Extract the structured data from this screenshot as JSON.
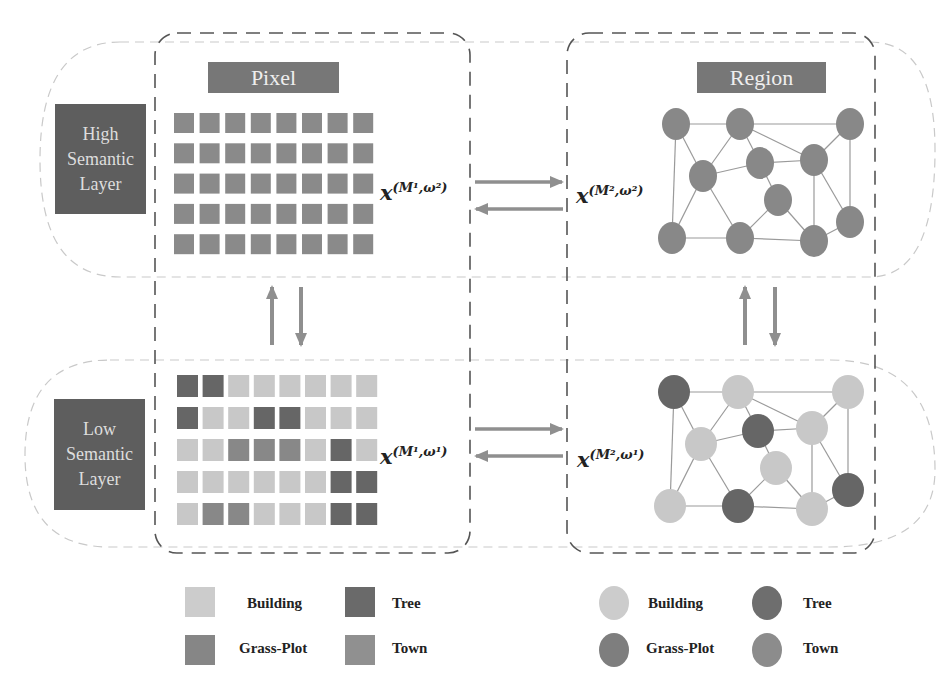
{
  "colors": {
    "building": "#c8c8c8",
    "tree": "#666666",
    "grass_plot": "#888888",
    "town": "#8a8a8a",
    "high_pixel": "#8a8a8a",
    "high_node": "#888888",
    "arrow": "#8f8f8f",
    "layer_box": "#5e5e5e",
    "title_box": "#777777"
  },
  "columns": {
    "pixel": {
      "title": "Pixel"
    },
    "region": {
      "title": "Region"
    }
  },
  "layers": {
    "high": {
      "label_lines": [
        "High",
        "Semantic",
        "Layer"
      ]
    },
    "low": {
      "label_lines": [
        "Low",
        "Semantic",
        "Layer"
      ]
    }
  },
  "labels": {
    "pixel_high": {
      "base": "x",
      "sup": "(M¹,ω²)"
    },
    "region_high": {
      "base": "x",
      "sup": "(M²,ω²)"
    },
    "pixel_low": {
      "base": "x",
      "sup": "(M¹,ω¹)"
    },
    "region_low": {
      "base": "x",
      "sup": "(M²,ω¹)"
    }
  },
  "pixel_grid_low": [
    [
      "T",
      "T",
      "B",
      "B",
      "B",
      "B",
      "B",
      "B"
    ],
    [
      "T",
      "B",
      "B",
      "T",
      "T",
      "B",
      "B",
      "B"
    ],
    [
      "B",
      "B",
      "G",
      "G",
      "G",
      "B",
      "T",
      "B"
    ],
    [
      "B",
      "B",
      "B",
      "B",
      "B",
      "B",
      "T",
      "T"
    ],
    [
      "B",
      "G",
      "G",
      "B",
      "B",
      "B",
      "T",
      "T"
    ]
  ],
  "region_nodes_low": [
    "T",
    "B",
    "B",
    "B",
    "T",
    "B",
    "B",
    "B",
    "B",
    "T",
    "B",
    "T"
  ],
  "legend": {
    "pixel": [
      {
        "label": "Building",
        "key": "B"
      },
      {
        "label": "Tree",
        "key": "T"
      },
      {
        "label": "Grass-Plot",
        "key": "G"
      },
      {
        "label": "Town",
        "key": "W"
      }
    ],
    "region": [
      {
        "label": "Building",
        "key": "B"
      },
      {
        "label": "Tree",
        "key": "T"
      },
      {
        "label": "Grass-Plot",
        "key": "G"
      },
      {
        "label": "Town",
        "key": "W"
      }
    ]
  }
}
